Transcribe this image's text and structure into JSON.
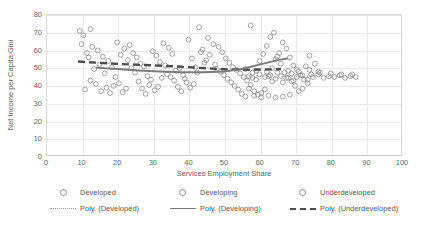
{
  "chart_data": {
    "type": "scatter",
    "title": "",
    "xlabel": "Services Employment Share",
    "ylabel": "Net Income per Capita Gini",
    "xlim": [
      0,
      100
    ],
    "ylim": [
      0,
      80
    ],
    "xticks": [
      0,
      10,
      20,
      30,
      40,
      50,
      60,
      70,
      80,
      90,
      100
    ],
    "yticks": [
      0,
      10,
      20,
      30,
      40,
      50,
      60,
      70,
      80
    ],
    "grid": true,
    "legend_position": "bottom",
    "legend_entries": [
      "Developed",
      "Developing",
      "Underdeveloped",
      "Poly. (Developed)",
      "Poly. (Developing)",
      "Poly. (Underdeveloped)"
    ],
    "series": [
      {
        "name": "Underdeveloped",
        "marker": "open-circle",
        "color": "#8c8c8c",
        "points": [
          [
            9.5,
            70.5
          ],
          [
            10.5,
            68.0
          ],
          [
            12.5,
            71.5
          ],
          [
            10.0,
            63.0
          ],
          [
            13.0,
            61.5
          ],
          [
            11.5,
            58.0
          ],
          [
            14.5,
            59.5
          ],
          [
            12.0,
            55.5
          ],
          [
            16.0,
            56.0
          ],
          [
            15.0,
            51.5
          ],
          [
            17.5,
            53.5
          ],
          [
            13.5,
            49.0
          ],
          [
            18.5,
            50.0
          ],
          [
            16.5,
            46.5
          ],
          [
            19.5,
            44.5
          ],
          [
            12.5,
            42.5
          ],
          [
            14.0,
            40.5
          ],
          [
            11.0,
            37.5
          ],
          [
            15.5,
            36.5
          ],
          [
            17.0,
            38.5
          ],
          [
            19.0,
            39.5
          ],
          [
            20.5,
            41.0
          ],
          [
            21.5,
            36.0
          ],
          [
            18.0,
            35.5
          ],
          [
            22.5,
            38.0
          ],
          [
            20.0,
            64.0
          ],
          [
            22.0,
            60.5
          ],
          [
            23.5,
            62.5
          ],
          [
            21.0,
            57.0
          ],
          [
            24.5,
            58.0
          ],
          [
            23.0,
            54.0
          ],
          [
            25.5,
            55.5
          ],
          [
            26.5,
            52.0
          ],
          [
            24.0,
            49.5
          ],
          [
            27.5,
            50.5
          ],
          [
            25.0,
            47.0
          ],
          [
            28.5,
            45.0
          ],
          [
            26.0,
            42.0
          ],
          [
            29.0,
            40.0
          ],
          [
            27.0,
            38.0
          ],
          [
            30.5,
            37.0
          ],
          [
            28.0,
            35.0
          ],
          [
            31.5,
            39.0
          ],
          [
            29.5,
            43.0
          ],
          [
            32.5,
            44.0
          ],
          [
            30.0,
            59.0
          ],
          [
            33.0,
            63.5
          ],
          [
            31.0,
            56.5
          ],
          [
            34.5,
            61.0
          ],
          [
            32.0,
            53.0
          ],
          [
            35.5,
            57.5
          ],
          [
            33.5,
            51.0
          ],
          [
            36.5,
            48.0
          ],
          [
            34.0,
            46.0
          ],
          [
            37.5,
            49.5
          ],
          [
            35.0,
            44.5
          ],
          [
            38.5,
            45.5
          ],
          [
            36.0,
            42.5
          ],
          [
            39.5,
            41.5
          ],
          [
            37.0,
            39.0
          ],
          [
            40.5,
            38.5
          ],
          [
            38.0,
            36.5
          ],
          [
            41.5,
            40.5
          ],
          [
            39.0,
            43.5
          ],
          [
            42.5,
            47.0
          ],
          [
            40.0,
            65.5
          ],
          [
            43.5,
            58.5
          ],
          [
            41.0,
            55.0
          ],
          [
            44.5,
            52.5
          ],
          [
            42.0,
            50.0
          ]
        ]
      },
      {
        "name": "Developing",
        "marker": "open-circle",
        "color": "#8c8c8c",
        "points": [
          [
            43.0,
            72.5
          ],
          [
            45.5,
            66.5
          ],
          [
            47.0,
            63.0
          ],
          [
            44.0,
            60.0
          ],
          [
            48.5,
            61.5
          ],
          [
            46.0,
            57.0
          ],
          [
            49.5,
            58.5
          ],
          [
            45.0,
            54.0
          ],
          [
            50.5,
            55.0
          ],
          [
            47.5,
            51.5
          ],
          [
            51.5,
            52.5
          ],
          [
            48.0,
            49.0
          ],
          [
            52.5,
            50.0
          ],
          [
            49.0,
            47.5
          ],
          [
            53.5,
            48.5
          ],
          [
            50.0,
            45.5
          ],
          [
            54.5,
            46.5
          ],
          [
            51.0,
            43.5
          ],
          [
            55.5,
            44.5
          ],
          [
            52.0,
            41.5
          ],
          [
            56.5,
            42.5
          ],
          [
            53.0,
            39.5
          ],
          [
            57.5,
            40.0
          ],
          [
            54.0,
            37.5
          ],
          [
            58.5,
            36.5
          ],
          [
            55.0,
            35.0
          ],
          [
            59.5,
            34.5
          ],
          [
            56.0,
            33.5
          ],
          [
            60.5,
            35.5
          ],
          [
            57.0,
            38.0
          ],
          [
            61.5,
            37.5
          ],
          [
            58.0,
            44.0
          ],
          [
            62.5,
            45.0
          ],
          [
            59.0,
            48.0
          ],
          [
            63.5,
            49.5
          ],
          [
            60.0,
            53.5
          ],
          [
            64.5,
            54.5
          ],
          [
            61.0,
            57.5
          ],
          [
            65.5,
            58.0
          ],
          [
            62.0,
            62.0
          ],
          [
            66.5,
            64.0
          ],
          [
            63.0,
            67.0
          ],
          [
            57.5,
            73.5
          ],
          [
            64.0,
            69.5
          ],
          [
            67.5,
            60.5
          ],
          [
            65.0,
            56.0
          ],
          [
            68.5,
            55.5
          ],
          [
            66.0,
            52.0
          ],
          [
            69.5,
            51.0
          ],
          [
            67.0,
            47.0
          ],
          [
            70.5,
            48.5
          ],
          [
            68.0,
            44.0
          ],
          [
            71.5,
            45.5
          ],
          [
            69.0,
            42.0
          ],
          [
            72.5,
            43.0
          ],
          [
            70.0,
            39.5
          ],
          [
            73.5,
            41.0
          ],
          [
            71.0,
            36.5
          ],
          [
            62.5,
            34.0
          ],
          [
            64.5,
            33.0
          ],
          [
            66.5,
            33.5
          ],
          [
            68.5,
            34.5
          ],
          [
            60.5,
            33.0
          ],
          [
            58.5,
            34.0
          ],
          [
            72.0,
            38.0
          ],
          [
            74.5,
            46.0
          ],
          [
            73.0,
            50.5
          ],
          [
            75.5,
            52.0
          ],
          [
            74.0,
            56.5
          ],
          [
            76.5,
            47.5
          ]
        ]
      },
      {
        "name": "Developed",
        "marker": "open-circle",
        "color": "#8c8c8c",
        "points": [
          [
            60.0,
            46.0
          ],
          [
            61.5,
            44.5
          ],
          [
            63.0,
            45.5
          ],
          [
            64.5,
            43.5
          ],
          [
            66.0,
            45.0
          ],
          [
            67.5,
            44.0
          ],
          [
            69.0,
            46.5
          ],
          [
            70.5,
            44.5
          ],
          [
            72.0,
            45.5
          ],
          [
            73.5,
            43.0
          ],
          [
            75.0,
            44.5
          ],
          [
            76.5,
            46.0
          ],
          [
            78.0,
            44.0
          ],
          [
            79.5,
            45.0
          ],
          [
            81.0,
            44.5
          ],
          [
            82.5,
            45.5
          ],
          [
            84.0,
            44.0
          ],
          [
            85.5,
            45.0
          ],
          [
            87.0,
            44.5
          ],
          [
            62.0,
            47.5
          ],
          [
            65.0,
            47.0
          ],
          [
            68.0,
            48.0
          ],
          [
            71.0,
            47.5
          ],
          [
            74.0,
            48.5
          ],
          [
            77.0,
            47.0
          ],
          [
            80.0,
            46.5
          ],
          [
            83.0,
            46.0
          ],
          [
            86.0,
            46.0
          ],
          [
            63.5,
            42.0
          ],
          [
            66.5,
            41.5
          ],
          [
            69.5,
            42.5
          ],
          [
            59.0,
            43.0
          ],
          [
            58.0,
            47.0
          ],
          [
            57.0,
            45.0
          ],
          [
            56.0,
            49.0
          ]
        ]
      }
    ],
    "trendlines": [
      {
        "name": "Poly. (Underdeveloped)",
        "style": "long-dash",
        "color": "#4d4d4d",
        "points": [
          [
            9.0,
            53.2
          ],
          [
            15.0,
            52.5
          ],
          [
            21.0,
            51.8
          ],
          [
            27.0,
            51.3
          ],
          [
            33.0,
            50.8
          ],
          [
            39.0,
            50.2
          ],
          [
            45.0,
            49.4
          ],
          [
            51.0,
            48.8
          ],
          [
            57.0,
            48.6
          ],
          [
            63.0,
            48.8
          ],
          [
            66.0,
            49.0
          ]
        ]
      },
      {
        "name": "Poly. (Developing)",
        "style": "medium-dash",
        "color": "#7a7a7a",
        "points": [
          [
            14.0,
            49.8
          ],
          [
            20.0,
            49.0
          ],
          [
            26.0,
            48.2
          ],
          [
            32.0,
            47.6
          ],
          [
            38.0,
            47.2
          ],
          [
            44.0,
            47.2
          ],
          [
            50.0,
            47.6
          ],
          [
            55.0,
            49.0
          ],
          [
            60.0,
            51.5
          ],
          [
            65.0,
            54.0
          ],
          [
            68.0,
            55.0
          ]
        ]
      },
      {
        "name": "Poly. (Developed)",
        "style": "dotted",
        "color": "#9a9a9a",
        "points": [
          [
            55.0,
            45.2
          ],
          [
            62.0,
            45.0
          ],
          [
            69.0,
            44.8
          ],
          [
            76.0,
            44.7
          ],
          [
            83.0,
            44.6
          ],
          [
            87.0,
            44.6
          ]
        ]
      }
    ]
  }
}
